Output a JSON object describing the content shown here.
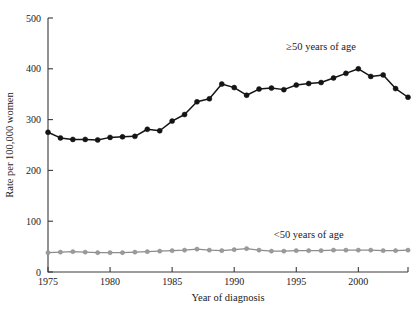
{
  "figure": {
    "background_color": "#ffffff",
    "ink_color": "#141414",
    "secondary_color": "#8c8c8c"
  },
  "chart_data": {
    "type": "line",
    "title": "",
    "subtitle": "",
    "xlabel": "Year of diagnosis",
    "ylabel": "Rate per 100,000 women",
    "xlim": [
      1975,
      2004
    ],
    "ylim": [
      0,
      500
    ],
    "yticks": [
      0,
      100,
      200,
      300,
      400,
      500
    ],
    "ytick_labels": [
      "0",
      "100",
      "200",
      "300",
      "400",
      "500"
    ],
    "xticks": [
      1975,
      1980,
      1985,
      1990,
      1995,
      2000
    ],
    "xtick_labels": [
      "1975",
      "1980",
      "1985",
      "1990",
      "1995",
      "2000"
    ],
    "grid": false,
    "legend_position": "inline-annotation",
    "x": [
      1975,
      1976,
      1977,
      1978,
      1979,
      1980,
      1981,
      1982,
      1983,
      1984,
      1985,
      1986,
      1987,
      1988,
      1989,
      1990,
      1991,
      1992,
      1993,
      1994,
      1995,
      1996,
      1997,
      1998,
      1999,
      2000,
      2001,
      2002,
      2003,
      2004
    ],
    "series": [
      {
        "name": "≥50 years of age",
        "color": "#141414",
        "marker": "filled-circle",
        "annotation": "≥50 years of age",
        "annotation_x": 1997,
        "annotation_y": 437,
        "values": [
          275,
          264,
          261,
          261,
          260,
          265,
          266,
          267,
          281,
          278,
          297,
          310,
          335,
          341,
          370,
          363,
          348,
          360,
          362,
          359,
          368,
          371,
          373,
          382,
          391,
          400,
          385,
          388,
          361,
          344
        ]
      },
      {
        "name": "<50 years of age",
        "color": "#8c8c8c",
        "marker": "filled-circle",
        "annotation": "<50 years of age",
        "annotation_x": 1996,
        "annotation_y": 66,
        "values": [
          38,
          39,
          40,
          39,
          38,
          38,
          38,
          39,
          40,
          41,
          42,
          43,
          45,
          43,
          42,
          44,
          46,
          43,
          41,
          41,
          42,
          42,
          42,
          43,
          43,
          43,
          43,
          42,
          42,
          43
        ]
      }
    ]
  }
}
